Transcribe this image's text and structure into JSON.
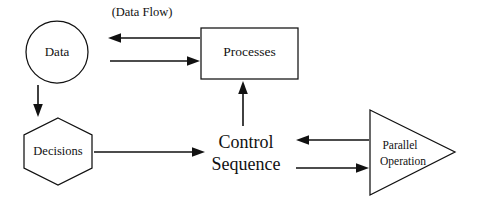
{
  "diagram": {
    "background_color": "#ffffff",
    "line_color": "#111111",
    "annotations": [
      {
        "id": "data-flow-annotation",
        "text": "(Data Flow)"
      }
    ],
    "nodes": [
      {
        "id": "data",
        "shape": "circle",
        "label": "Data"
      },
      {
        "id": "processes",
        "shape": "rectangle",
        "label": "Processes"
      },
      {
        "id": "decisions",
        "shape": "hexagon",
        "label": "Decisions"
      },
      {
        "id": "control-sequence",
        "shape": "text",
        "label_line1": "Control",
        "label_line2": "Sequence"
      },
      {
        "id": "parallel-operation",
        "shape": "triangle",
        "label_line1": "Parallel",
        "label_line2": "Operation"
      }
    ],
    "edges": [
      {
        "id": "processes-to-data",
        "from": "processes",
        "to": "data",
        "direction": "left"
      },
      {
        "id": "data-to-processes",
        "from": "data",
        "to": "processes",
        "direction": "right"
      },
      {
        "id": "data-to-decisions",
        "from": "data",
        "to": "decisions",
        "direction": "down"
      },
      {
        "id": "decisions-to-control",
        "from": "decisions",
        "to": "control-sequence",
        "direction": "right"
      },
      {
        "id": "control-to-processes",
        "from": "control-sequence",
        "to": "processes",
        "direction": "up"
      },
      {
        "id": "parallel-to-control",
        "from": "parallel-operation",
        "to": "control-sequence",
        "direction": "left"
      },
      {
        "id": "control-to-parallel",
        "from": "control-sequence",
        "to": "parallel-operation",
        "direction": "right"
      }
    ]
  }
}
